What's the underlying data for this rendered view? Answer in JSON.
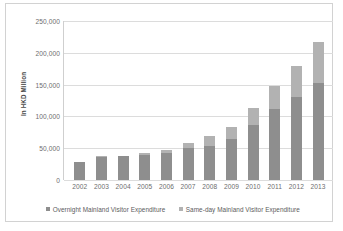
{
  "chart_data": {
    "type": "bar",
    "subtype": "stacked-vertical",
    "title": "",
    "xlabel": "",
    "ylabel": "In HKD Million",
    "ylim": [
      0,
      250000
    ],
    "ytick_labels": [
      "250,000",
      "200,000",
      "150,000",
      "100,000",
      "50,000",
      "0"
    ],
    "ytick_values": [
      250000,
      200000,
      150000,
      100000,
      50000,
      0
    ],
    "grid": true,
    "legend_position": "bottom",
    "categories": [
      "2002",
      "2003",
      "2004",
      "2005",
      "2006",
      "2007",
      "2008",
      "2009",
      "2010",
      "2011",
      "2012",
      "2013"
    ],
    "series": [
      {
        "name": "Overnight Mainland Visitor Expenditure",
        "color": "#8e8e8e",
        "values": [
          28000,
          36000,
          37000,
          40000,
          42000,
          51000,
          53000,
          64000,
          86000,
          112000,
          130000,
          153000
        ]
      },
      {
        "name": "Same-day Mainland Visitor Expenditure",
        "color": "#b2b2b2",
        "values": [
          1000,
          1000,
          1000,
          2000,
          5000,
          7000,
          16000,
          19000,
          27000,
          36000,
          49000,
          64000
        ]
      }
    ],
    "totals": [
      29000,
      37000,
      38000,
      42000,
      47000,
      58000,
      69000,
      83000,
      113000,
      148000,
      179000,
      217000
    ]
  },
  "legend": {
    "entries": [
      {
        "label": "Overnight Mainland Visitor Expenditure"
      },
      {
        "label": "Same-day Mainland Visitor Expenditure"
      }
    ]
  }
}
